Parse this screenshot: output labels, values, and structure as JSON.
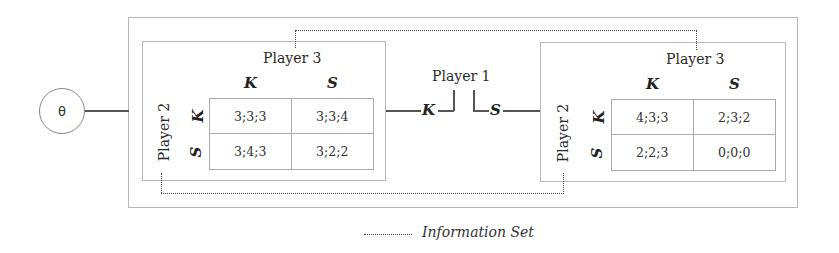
{
  "diagram": {
    "root_node": {
      "label": "θ"
    },
    "player1": {
      "label": "Player 1",
      "actions": [
        {
          "label": "K"
        },
        {
          "label": "S"
        }
      ]
    },
    "subgames": [
      {
        "branch": "K",
        "row_player": "Player 2",
        "col_player": "Player 3",
        "col_strategies": [
          "K",
          "S"
        ],
        "row_strategies": [
          "K",
          "S"
        ],
        "payoffs": [
          [
            "3;3;3",
            "3;3;4"
          ],
          [
            "3;4;3",
            "3;2;2"
          ]
        ]
      },
      {
        "branch": "S",
        "row_player": "Player 2",
        "col_player": "Player 3",
        "col_strategies": [
          "K",
          "S"
        ],
        "row_strategies": [
          "K",
          "S"
        ],
        "payoffs": [
          [
            "4;3;3",
            "2;3;2"
          ],
          [
            "2;2;3",
            "0;0;0"
          ]
        ]
      }
    ],
    "legend": {
      "label": "Information Set"
    }
  }
}
